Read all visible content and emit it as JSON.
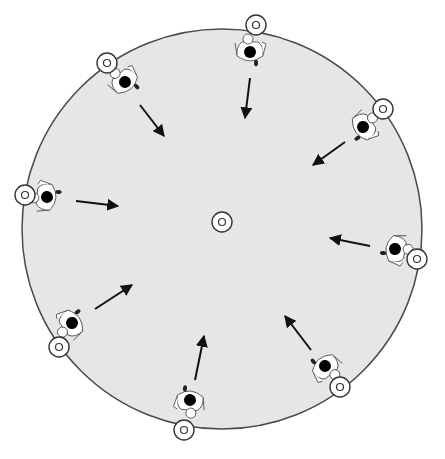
{
  "diagram": {
    "type": "drill-diagram",
    "colors": {
      "field_fill": "#e6e6e6",
      "field_stroke": "#4a4a4a",
      "cone_fill": "#ffffff",
      "cone_stroke": "#333333",
      "player_head": "#000000",
      "player_body": "#ffffff",
      "arrow": "#111111"
    },
    "field": {
      "cx": 222,
      "cy": 229,
      "r": 200
    },
    "center_cone": {
      "x": 222,
      "y": 222
    },
    "cones": [
      {
        "x": 256,
        "y": 25
      },
      {
        "x": 107,
        "y": 63
      },
      {
        "x": 383,
        "y": 109
      },
      {
        "x": 25,
        "y": 195
      },
      {
        "x": 417,
        "y": 259
      },
      {
        "x": 59,
        "y": 347
      },
      {
        "x": 340,
        "y": 387
      },
      {
        "x": 184,
        "y": 430
      }
    ],
    "players": [
      {
        "x": 250,
        "y": 52,
        "angle": 180
      },
      {
        "x": 125,
        "y": 82,
        "angle": 140
      },
      {
        "x": 363,
        "y": 127,
        "angle": 235
      },
      {
        "x": 47,
        "y": 197,
        "angle": 95
      },
      {
        "x": 395,
        "y": 249,
        "angle": 280
      },
      {
        "x": 72,
        "y": 323,
        "angle": 55
      },
      {
        "x": 190,
        "y": 400,
        "angle": 5
      },
      {
        "x": 325,
        "y": 366,
        "angle": 320
      }
    ],
    "arrows": [
      {
        "x1": 250,
        "y1": 78,
        "x2": 245,
        "y2": 118
      },
      {
        "x1": 140,
        "y1": 105,
        "x2": 164,
        "y2": 136
      },
      {
        "x1": 345,
        "y1": 142,
        "x2": 313,
        "y2": 165
      },
      {
        "x1": 76,
        "y1": 201,
        "x2": 118,
        "y2": 206
      },
      {
        "x1": 370,
        "y1": 246,
        "x2": 330,
        "y2": 238
      },
      {
        "x1": 95,
        "y1": 309,
        "x2": 132,
        "y2": 285
      },
      {
        "x1": 195,
        "y1": 380,
        "x2": 204,
        "y2": 336
      },
      {
        "x1": 311,
        "y1": 350,
        "x2": 285,
        "y2": 316
      }
    ]
  }
}
